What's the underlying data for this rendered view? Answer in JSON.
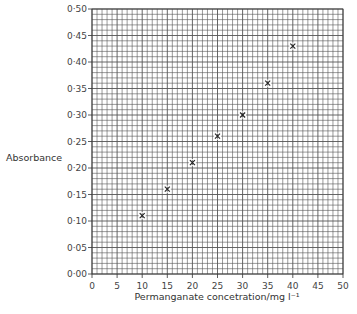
{
  "chart_data": {
    "type": "scatter",
    "title": "",
    "xlabel": "Permanganate concetration/mg l⁻¹",
    "ylabel": "Absorbance",
    "xlim": [
      0,
      50
    ],
    "ylim": [
      0.0,
      0.5
    ],
    "x_ticks": [
      "0",
      "5",
      "10",
      "15",
      "20",
      "25",
      "30",
      "35",
      "40",
      "45",
      "50"
    ],
    "y_ticks": [
      "0·00",
      "0·05",
      "0·10",
      "0·15",
      "0·20",
      "0·25",
      "0·30",
      "0·35",
      "0·40",
      "0·45",
      "0·50"
    ],
    "grid": true,
    "grid_minor_x": 1,
    "grid_minor_y": 0.01,
    "marker": "×",
    "series": [
      {
        "name": "Absorbance",
        "x": [
          10,
          15,
          20,
          25,
          30,
          35,
          40
        ],
        "y": [
          0.11,
          0.16,
          0.21,
          0.26,
          0.3,
          0.36,
          0.43
        ]
      }
    ]
  },
  "colors": {
    "grid": "#555555",
    "axis": "#333333",
    "marker": "#222222"
  }
}
